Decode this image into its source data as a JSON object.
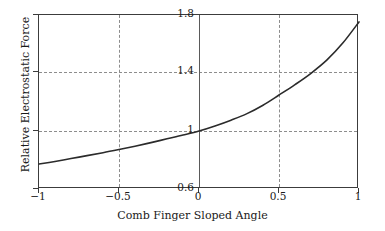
{
  "chart_data": {
    "type": "line",
    "title": "",
    "xlabel": "Comb Finger Sloped Angle",
    "ylabel": "Relative Electrostatic Force",
    "xlim": [
      -1,
      1
    ],
    "ylim": [
      0.6,
      1.8
    ],
    "grid": true,
    "legend": null,
    "x_ticks": [
      -1,
      -0.5,
      0,
      0.5,
      1
    ],
    "x_tick_labels": [
      "−1",
      "−0.5",
      "0",
      "0.5",
      "1"
    ],
    "y_ticks": [
      0.6,
      1.0,
      1.4,
      1.8
    ],
    "y_tick_labels": [
      "0.6",
      "1",
      "1.4",
      "1.8"
    ],
    "series": [
      {
        "name": "Relative Electrostatic Force",
        "color": "#2b2b2b",
        "x": [
          -1.0,
          -0.9,
          -0.8,
          -0.7,
          -0.6,
          -0.5,
          -0.4,
          -0.3,
          -0.2,
          -0.1,
          0.0,
          0.1,
          0.2,
          0.3,
          0.4,
          0.5,
          0.6,
          0.7,
          0.8,
          0.9,
          1.0
        ],
        "values": [
          0.772,
          0.79,
          0.81,
          0.83,
          0.85,
          0.872,
          0.895,
          0.92,
          0.946,
          0.972,
          1.0,
          1.035,
          1.075,
          1.12,
          1.178,
          1.248,
          1.32,
          1.398,
          1.49,
          1.608,
          1.752
        ]
      }
    ]
  },
  "axes": {
    "x_title": "Comb Finger Sloped Angle",
    "y_title": "Relative Electrostatic Force",
    "x_tick_labels": [
      "−1",
      "−0.5",
      "0",
      "0.5",
      "1"
    ],
    "y_tick_labels": [
      "1.8",
      "1.4",
      "1",
      "0.6"
    ]
  },
  "style": {
    "curve_color": "#2b2b2b",
    "grid_color": "#8d8d8d",
    "frame_color": "#3c3c3c",
    "background": "#ffffff"
  }
}
